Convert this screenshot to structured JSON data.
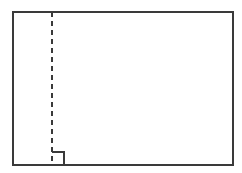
{
  "figure": {
    "canvas": {
      "width": 242,
      "height": 173,
      "background_color": "#ffffff"
    },
    "stroke": {
      "color": "#3a3a3a",
      "width": 2,
      "linecap": "square"
    },
    "rectangle": {
      "label": "outer-rectangle",
      "x": 13,
      "y": 12,
      "width": 220,
      "height": 153,
      "fill": "none",
      "stroke_color": "#3a3a3a",
      "stroke_width": 2
    },
    "dashed_line": {
      "label": "vertical-dashed-line",
      "x": 51.5,
      "y_start": 12,
      "y_end": 165,
      "stroke_color": "#3a3a3a",
      "stroke_width": 2,
      "dash_length": 5,
      "gap_length": 4,
      "dash_array": "5 4"
    },
    "square_marker": {
      "label": "right-angle-square-marker",
      "x": 51.5,
      "y": 152,
      "width": 12.5,
      "height": 13,
      "fill": "none",
      "stroke_color": "#3a3a3a",
      "stroke_width": 2,
      "drawn_sides": [
        "top",
        "right"
      ],
      "meaning": "right-angle indicator at base of dashed line"
    }
  }
}
